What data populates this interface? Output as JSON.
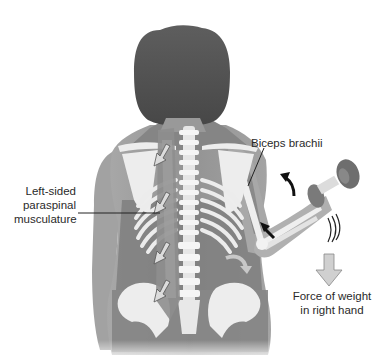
{
  "figure": {
    "labels": {
      "paraspinal": [
        "Left-sided",
        "paraspinal",
        "musculature"
      ],
      "biceps": "Biceps brachii",
      "force": [
        "Force of weight",
        "in right hand"
      ]
    },
    "arrows": {
      "paraspinal_contraction_count": 4,
      "arm_curl_arrow": "curved black arrow indicating upward flexion",
      "biceps_pull_arrow": "black arrow at elbow pointing up the arm",
      "trunk_lean_arrow": "curved gray arrow beside waist",
      "weight_force_arrow": "gray downward arrow under dumbbell"
    },
    "colors": {
      "skin": "#9a9a9a",
      "muscle": "#7c7c7c",
      "bone": "#ededed",
      "hair": "#555555",
      "arrow_dark": "#111111",
      "arrow_light": "#d0d0d0",
      "text": "#2a2a2a"
    }
  }
}
